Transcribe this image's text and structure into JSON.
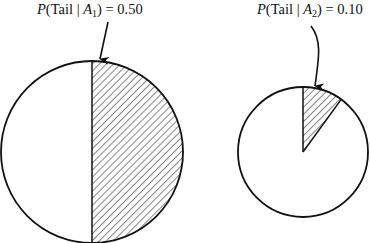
{
  "diagram": {
    "type": "probability-pie-comparison",
    "colors": {
      "stroke": "#111111",
      "hatch": "#222222",
      "background": "#ffffff"
    },
    "panels": [
      {
        "id": "A1",
        "label": {
          "func": "P",
          "open": "(Tail | ",
          "var": "A",
          "sub": "1",
          "close": ") = ",
          "value": "0.50"
        },
        "probability": 0.5,
        "shaded_portion": "right half (hatched)",
        "arrow_style": "straight"
      },
      {
        "id": "A2",
        "label": {
          "func": "P",
          "open": "(Tail | ",
          "var": "A",
          "sub": "2",
          "close": ") = ",
          "value": "0.10"
        },
        "probability": 0.1,
        "shaded_portion": "36-degree wedge from top (hatched)",
        "arrow_style": "curved"
      }
    ]
  }
}
